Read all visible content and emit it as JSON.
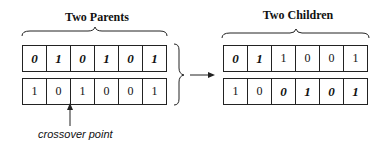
{
  "parents": {
    "title": "Two Parents",
    "rows": [
      [
        {
          "v": "0",
          "b": true
        },
        {
          "v": "1",
          "b": true
        },
        {
          "v": "0",
          "b": true
        },
        {
          "v": "1",
          "b": true
        },
        {
          "v": "0",
          "b": true
        },
        {
          "v": "1",
          "b": true
        }
      ],
      [
        {
          "v": "1",
          "b": false
        },
        {
          "v": "0",
          "b": false
        },
        {
          "v": "1",
          "b": false
        },
        {
          "v": "0",
          "b": false
        },
        {
          "v": "0",
          "b": false
        },
        {
          "v": "1",
          "b": false
        }
      ]
    ]
  },
  "children": {
    "title": "Two Children",
    "rows": [
      [
        {
          "v": "0",
          "b": true
        },
        {
          "v": "1",
          "b": true
        },
        {
          "v": "1",
          "b": false
        },
        {
          "v": "0",
          "b": false
        },
        {
          "v": "0",
          "b": false
        },
        {
          "v": "1",
          "b": false
        }
      ],
      [
        {
          "v": "1",
          "b": false
        },
        {
          "v": "0",
          "b": false
        },
        {
          "v": "0",
          "b": true
        },
        {
          "v": "1",
          "b": true
        },
        {
          "v": "0",
          "b": true
        },
        {
          "v": "1",
          "b": true
        }
      ]
    ]
  },
  "crossover_label": "crossover point"
}
